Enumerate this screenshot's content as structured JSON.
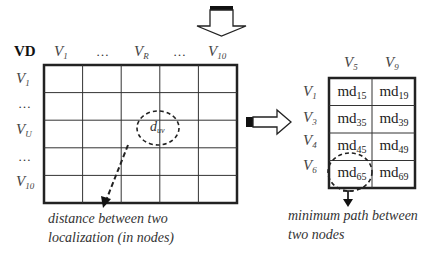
{
  "distance_matrix": {
    "corner_label": "VD",
    "column_headers": [
      {
        "base": "V",
        "sub": "1"
      },
      {
        "base": "…",
        "sub": ""
      },
      {
        "base": "V",
        "sub": "R"
      },
      {
        "base": "…",
        "sub": ""
      },
      {
        "base": "V",
        "sub": "10"
      }
    ],
    "row_headers": [
      {
        "base": "V",
        "sub": "1"
      },
      {
        "base": "…",
        "sub": ""
      },
      {
        "base": "V",
        "sub": "U"
      },
      {
        "base": "…",
        "sub": ""
      },
      {
        "base": "V",
        "sub": "10"
      }
    ],
    "grid_rows": 5,
    "grid_cols": 5,
    "highlight_cell": {
      "base": "d",
      "sub": "uv",
      "row": 2,
      "col": 2
    },
    "caption_line1": "distance between two",
    "caption_line2": "localization (in nodes)"
  },
  "path_matrix": {
    "column_headers": [
      {
        "base": "V",
        "sub": "5"
      },
      {
        "base": "V",
        "sub": "9"
      }
    ],
    "row_headers": [
      {
        "base": "V",
        "sub": "1"
      },
      {
        "base": "V",
        "sub": "3"
      },
      {
        "base": "V",
        "sub": "4"
      },
      {
        "base": "V",
        "sub": "6"
      }
    ],
    "cells": [
      [
        {
          "base": "md",
          "sub": "15"
        },
        {
          "base": "md",
          "sub": "19"
        }
      ],
      [
        {
          "base": "md",
          "sub": "35"
        },
        {
          "base": "md",
          "sub": "39"
        }
      ],
      [
        {
          "base": "md",
          "sub": "45"
        },
        {
          "base": "md",
          "sub": "49"
        }
      ],
      [
        {
          "base": "md",
          "sub": "65"
        },
        {
          "base": "md",
          "sub": "69"
        }
      ]
    ],
    "highlight_cell": {
      "row": 3,
      "col": 0
    },
    "caption_line1": "minimum path between",
    "caption_line2": "two nodes"
  },
  "arrows": {
    "top": "down-arrow",
    "middle": "right-arrow"
  }
}
